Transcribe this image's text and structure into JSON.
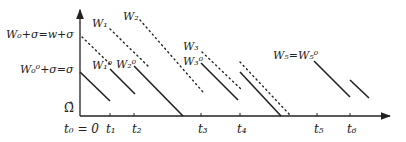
{
  "diagram": {
    "colors": {
      "ink": "#222222",
      "background": "#ffffff"
    },
    "y_axis": {
      "label_bottom": "Ω̂"
    },
    "y_labels": [
      {
        "id": "upper",
        "text": "W₀+σ=w+σ"
      },
      {
        "id": "lower",
        "text": "W₀⁰+σ=σ"
      }
    ],
    "x_ticks": [
      {
        "id": "t0",
        "text": "t₀ = 0"
      },
      {
        "id": "t1",
        "text": "t₁"
      },
      {
        "id": "t2",
        "text": "t₂"
      },
      {
        "id": "t3",
        "text": "t₃"
      },
      {
        "id": "t4",
        "text": "t₄"
      },
      {
        "id": "t5",
        "text": "t₅"
      },
      {
        "id": "t6",
        "text": "t₆"
      }
    ],
    "curve_labels": [
      {
        "id": "W1",
        "text": "W₁"
      },
      {
        "id": "W2",
        "text": "W₂"
      },
      {
        "id": "W1_0",
        "text": "W₁⁰"
      },
      {
        "id": "W2_0",
        "text": "W₂⁰"
      },
      {
        "id": "W3",
        "text": "W₃"
      },
      {
        "id": "W3_0",
        "text": "W₃⁰"
      },
      {
        "id": "W5",
        "text": "W₅=W₅⁰"
      }
    ]
  }
}
